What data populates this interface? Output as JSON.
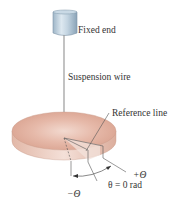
{
  "diagram": {
    "labels": {
      "fixed_end": "Fixed end",
      "suspension_wire": "Suspension wire",
      "reference_line": "Reference line",
      "plus_theta": "+Θ",
      "zero_theta": "θ = 0 rad",
      "minus_theta": "−Θ"
    },
    "colors": {
      "cylinder_light": "#d6e4ee",
      "cylinder_dark": "#8fa9bd",
      "disc_top_light": "#f3ddd4",
      "disc_top_dark": "#d9a594",
      "disc_side": "#e8c8bc",
      "line": "#555555",
      "text": "#333333"
    }
  }
}
